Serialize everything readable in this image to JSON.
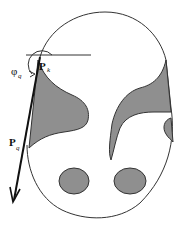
{
  "diagram": {
    "labels": {
      "pk_main": "P",
      "pk_sub": "k",
      "phi_main": "φ",
      "phi_sub": "q",
      "pq_main": "P",
      "pq_sub": "q"
    },
    "colors": {
      "outline": "#333333",
      "fill": "#8f8f8f",
      "background": "#ffffff"
    }
  }
}
